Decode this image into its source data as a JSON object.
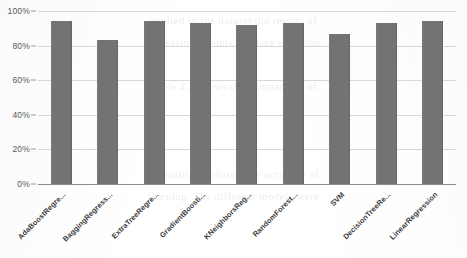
{
  "chart_data": {
    "type": "bar",
    "title": "",
    "xlabel": "",
    "ylabel": "",
    "ylim": [
      0,
      100
    ],
    "yticks": [
      "0%",
      "20%",
      "40%",
      "60%",
      "80%",
      "100%"
    ],
    "ytick_values": [
      0,
      20,
      40,
      60,
      80,
      100
    ],
    "grid": true,
    "legend": "none",
    "bar_color": "#737373",
    "gridline_color": "#d7d7d7",
    "axis_color": "#8e8e8e",
    "categories": [
      "AdaBoostRegre...",
      "BaggingRegress...",
      "ExtraTreeRegre...",
      "GradientBoosti...",
      "KNeighborsReg...",
      "RandomForest...",
      "SVM",
      "DecisionTreeRe...",
      "LinearRegression"
    ],
    "values": [
      94,
      83,
      94,
      93,
      92,
      93,
      87,
      93,
      94
    ]
  },
  "background_bleed": {
    "lines": [
      "applied to the dataset the results of",
      "regression models. Feature selection",
      "",
      "Table 4.2 shows the comparison of",
      "",
      "",
      "",
      "estimation performance accuracy of",
      "learning. The different models were"
    ]
  }
}
